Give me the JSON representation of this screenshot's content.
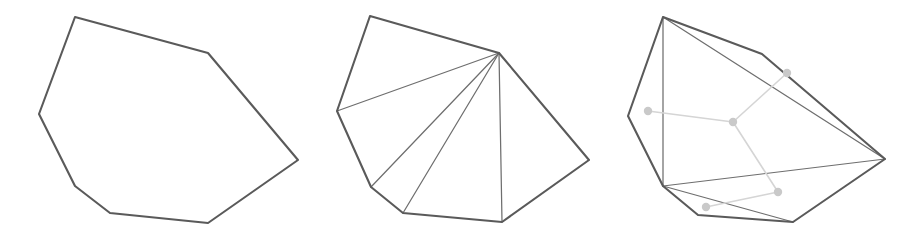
{
  "figure": {
    "width": 916,
    "height": 234,
    "background": "#ffffff",
    "colors": {
      "polygon_outline": "#5a5a5a",
      "diagonal": "#6e6e6e",
      "dual_edge": "#d5d5d5",
      "dual_node": "#c9c9c9"
    },
    "stroke_widths": {
      "polygon_outline": 2.1,
      "diagonal": 1.25,
      "dual_edge": 1.6
    },
    "dual_node_radius": 4.2
  },
  "panels": [
    {
      "id": "panel-simple-polygon",
      "label": "simple polygon",
      "origin_x": 0,
      "width": 305,
      "polygon_points": "75,17 208,53 298,160 208,223 110,213 75,186 39,114",
      "vertices": [
        {
          "name": "v0",
          "x": 75,
          "y": 17
        },
        {
          "name": "v1",
          "x": 208,
          "y": 53
        },
        {
          "name": "v2",
          "x": 298,
          "y": 160
        },
        {
          "name": "v3",
          "x": 208,
          "y": 223
        },
        {
          "name": "v4",
          "x": 110,
          "y": 213
        },
        {
          "name": "v5",
          "x": 75,
          "y": 186
        },
        {
          "name": "v6",
          "x": 39,
          "y": 114
        }
      ],
      "diagonals": [],
      "dual_nodes": [],
      "dual_edges": []
    },
    {
      "id": "panel-fan-triangulation",
      "label": "fan triangulation from apex",
      "origin_x": 0,
      "width": 305,
      "polygon_points": "370,16 499,53 589,160 502,222 403,213 371,187 337,111",
      "vertices": [
        {
          "name": "v0",
          "x": 370,
          "y": 16
        },
        {
          "name": "v1",
          "x": 499,
          "y": 53
        },
        {
          "name": "v2",
          "x": 589,
          "y": 160
        },
        {
          "name": "v3",
          "x": 502,
          "y": 222
        },
        {
          "name": "v4",
          "x": 403,
          "y": 213
        },
        {
          "name": "v5",
          "x": 371,
          "y": 187
        },
        {
          "name": "v6",
          "x": 337,
          "y": 111
        }
      ],
      "apex": {
        "x": 499,
        "y": 53
      },
      "diagonals": [
        {
          "name": "diagonal-apex-to-v6",
          "x1": 499,
          "y1": 53,
          "x2": 337,
          "y2": 111
        },
        {
          "name": "diagonal-apex-to-v5",
          "x1": 499,
          "y1": 53,
          "x2": 371,
          "y2": 187
        },
        {
          "name": "diagonal-apex-to-v4",
          "x1": 499,
          "y1": 53,
          "x2": 403,
          "y2": 213
        },
        {
          "name": "diagonal-apex-to-v3",
          "x1": 499,
          "y1": 53,
          "x2": 502,
          "y2": 222
        }
      ],
      "dual_nodes": [],
      "dual_edges": []
    },
    {
      "id": "panel-triangulation-with-dual",
      "label": "triangulation with dual tree",
      "origin_x": 0,
      "width": 306,
      "polygon_points": "663,17 762,54 885,159 793,222 698,215 663,186 628,116",
      "vertices": [
        {
          "name": "v0",
          "x": 663,
          "y": 17
        },
        {
          "name": "v1",
          "x": 762,
          "y": 54
        },
        {
          "name": "v2",
          "x": 885,
          "y": 159
        },
        {
          "name": "v3",
          "x": 793,
          "y": 222
        },
        {
          "name": "v4",
          "x": 698,
          "y": 215
        },
        {
          "name": "v5",
          "x": 663,
          "y": 186
        },
        {
          "name": "v6",
          "x": 628,
          "y": 116
        }
      ],
      "diagonals": [
        {
          "name": "diagonal-v0-v5",
          "x1": 663,
          "y1": 17,
          "x2": 663,
          "y2": 186
        },
        {
          "name": "diagonal-v0-v2",
          "x1": 663,
          "y1": 17,
          "x2": 885,
          "y2": 159
        },
        {
          "name": "diagonal-v5-v2",
          "x1": 663,
          "y1": 186,
          "x2": 885,
          "y2": 159
        },
        {
          "name": "diagonal-v5-v3",
          "x1": 663,
          "y1": 186,
          "x2": 793,
          "y2": 222
        }
      ],
      "dual_nodes": [
        {
          "name": "dual-node-left",
          "x": 648,
          "y": 111
        },
        {
          "name": "dual-node-center",
          "x": 733,
          "y": 122
        },
        {
          "name": "dual-node-upper-right",
          "x": 787,
          "y": 73
        },
        {
          "name": "dual-node-lower-right",
          "x": 778,
          "y": 192
        },
        {
          "name": "dual-node-bottom-left",
          "x": 706,
          "y": 207
        }
      ],
      "dual_edges": [
        {
          "name": "dual-edge-left-center",
          "x1": 648,
          "y1": 111,
          "x2": 733,
          "y2": 122
        },
        {
          "name": "dual-edge-center-upper-right",
          "x1": 733,
          "y1": 122,
          "x2": 787,
          "y2": 73
        },
        {
          "name": "dual-edge-center-lower-right",
          "x1": 733,
          "y1": 122,
          "x2": 778,
          "y2": 192
        },
        {
          "name": "dual-edge-lower-right-bottom-left",
          "x1": 778,
          "y1": 192,
          "x2": 706,
          "y2": 207
        }
      ]
    }
  ]
}
